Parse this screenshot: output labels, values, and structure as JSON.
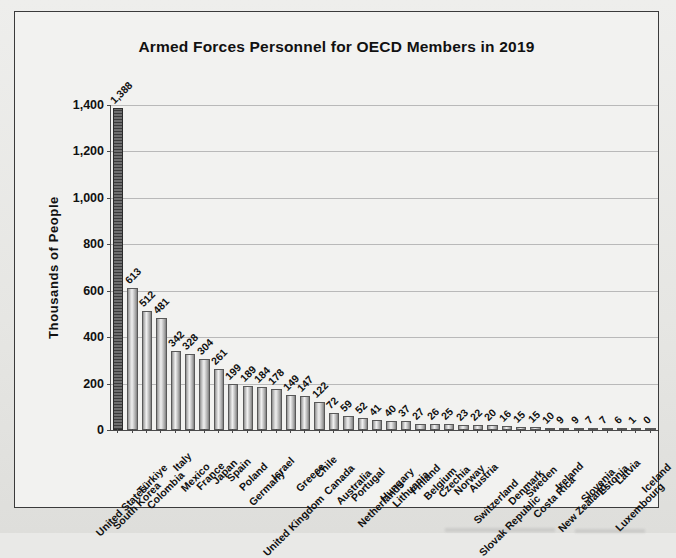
{
  "chart_data": {
    "type": "bar",
    "title": "Armed Forces Personnel for OECD Members in 2019",
    "xlabel": "",
    "ylabel": "Thousands  of  People",
    "ylim": [
      0,
      1400
    ],
    "ytick_labels": [
      "0",
      "200",
      "400",
      "600",
      "800",
      "1,000",
      "1,200",
      "1,400"
    ],
    "ytick_values": [
      0,
      200,
      400,
      600,
      800,
      1000,
      1200,
      1400
    ],
    "grid": true,
    "legend": "none",
    "categories": [
      "United States",
      "South Korea",
      "Türkiye",
      "Colombia",
      "Italy",
      "Mexico",
      "France",
      "Japan",
      "Spain",
      "Poland",
      "Germany",
      "Israel",
      "United Kingdom",
      "Greece",
      "Chile",
      "Canada",
      "Australia",
      "Portugal",
      "Netherlands",
      "Hungary",
      "Lithuania",
      "Finland",
      "Belgium",
      "Czechia",
      "Norway",
      "Austria",
      "Switzerland",
      "Slovak Republic",
      "Denmark",
      "Sweden",
      "Costa Rica",
      "Ireland",
      "New Zealand",
      "Slovenia",
      "Estonia",
      "Latvia",
      "Luxembourg",
      "Iceland"
    ],
    "values": [
      1388,
      613,
      512,
      481,
      342,
      328,
      304,
      261,
      199,
      189,
      184,
      178,
      149,
      147,
      122,
      72,
      59,
      52,
      41,
      40,
      37,
      27,
      26,
      25,
      23,
      22,
      20,
      16,
      15,
      15,
      10,
      9,
      9,
      7,
      7,
      6,
      1,
      0
    ],
    "value_labels": [
      "1,388",
      "613",
      "512",
      "481",
      "342",
      "328",
      "304",
      "261",
      "199",
      "189",
      "184",
      "178",
      "149",
      "147",
      "122",
      "72",
      "59",
      "52",
      "41",
      "40",
      "37",
      "27",
      "26",
      "25",
      "23",
      "22",
      "20",
      "16",
      "15",
      "15",
      "10",
      "9",
      "9",
      "7",
      "7",
      "6",
      "1",
      "0"
    ],
    "highlight_index": 0,
    "colors": {
      "bar_fill_light": "#d8d8d8",
      "bar_fill_highlight": "#4a4a4a",
      "bar_border": "#585858",
      "grid": "#b9b9b9",
      "axis": "#4a4a4a",
      "text": "#111111",
      "plot_background": "#f2f2f0",
      "page_background": "#e9e9e7"
    }
  }
}
